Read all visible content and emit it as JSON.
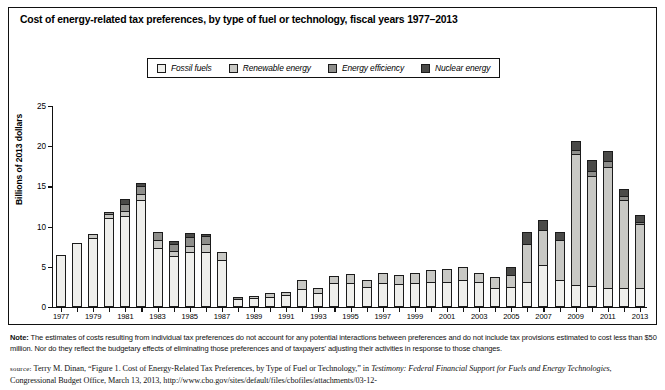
{
  "title": "Cost of energy-related tax preferences, by type of fuel or technology, fiscal years 1977–2013",
  "legend": {
    "items": [
      {
        "label": "Fossil fuels",
        "color": "#efefec"
      },
      {
        "label": "Renewable energy",
        "color": "#c8c8c4"
      },
      {
        "label": "Energy efficiency",
        "color": "#8e8e8b"
      },
      {
        "label": "Nuclear energy",
        "color": "#4a4a48"
      }
    ]
  },
  "note": {
    "label": "Note:",
    "text": "The estimates of costs resulting from individual tax preferences do not account for any potential interactions between preferences and do not include tax provisions estimated to cost less than $50 million. Nor do they reflect the budgetary effects of eliminating those preferences and of taxpayers’ adjusting their activities in response to those changes."
  },
  "source": {
    "label": "source:",
    "part1": "Terry M. Dinan, “Figure 1. Cost of Energy-Related Tax Preferences, by Type of Fuel or Technology,” in ",
    "italic1": "Testimony: Federal Financial Support for Fuels and Energy Technologies",
    "part2": ", Congressional Budget Office, March 13, 2013, http://www.cbo.gov/sites/default/files/cbofiles/attachments/03-12-"
  },
  "chart_data": {
    "type": "bar",
    "stacked": true,
    "title": "Cost of energy-related tax preferences, by type of fuel or technology, fiscal years 1977–2013",
    "xlabel": "",
    "ylabel": "Billions of 2013 dollars",
    "ylim": [
      0,
      25
    ],
    "yticks": [
      0,
      5,
      10,
      15,
      20,
      25
    ],
    "grid": false,
    "legend_position": "top",
    "categories": [
      "1977",
      "1978",
      "1979",
      "1980",
      "1981",
      "1982",
      "1983",
      "1984",
      "1985",
      "1986",
      "1987",
      "1988",
      "1989",
      "1990",
      "1991",
      "1992",
      "1993",
      "1994",
      "1995",
      "1996",
      "1997",
      "1998",
      "1999",
      "2000",
      "2001",
      "2002",
      "2003",
      "2004",
      "2005",
      "2006",
      "2007",
      "2008",
      "2009",
      "2010",
      "2011",
      "2012",
      "2013"
    ],
    "tick_labels": [
      "1977",
      "1979",
      "1981",
      "1983",
      "1985",
      "1987",
      "1989",
      "1991",
      "1993",
      "1995",
      "1997",
      "1999",
      "2001",
      "2003",
      "2005",
      "2007",
      "2009",
      "2011",
      "2013"
    ],
    "series": [
      {
        "name": "Fossil fuels",
        "color": "#efefec",
        "values": [
          6.5,
          8.0,
          8.6,
          11.1,
          11.3,
          13.3,
          7.3,
          6.3,
          6.8,
          6.9,
          5.9,
          1.0,
          1.1,
          1.3,
          1.5,
          2.2,
          1.7,
          3.0,
          3.0,
          2.5,
          3.0,
          2.9,
          3.0,
          3.1,
          3.1,
          3.4,
          3.1,
          2.4,
          2.5,
          3.1,
          5.2,
          3.3,
          2.7,
          2.6,
          2.4,
          2.4,
          2.4
        ]
      },
      {
        "name": "Renewable energy",
        "color": "#c8c8c4",
        "values": [
          0.0,
          0.0,
          0.6,
          0.6,
          0.7,
          0.9,
          1.1,
          0.8,
          0.9,
          1.0,
          1.1,
          0.0,
          0.4,
          0.5,
          0.5,
          1.3,
          0.8,
          1.0,
          1.2,
          1.0,
          1.3,
          1.2,
          1.4,
          1.6,
          1.7,
          1.7,
          1.3,
          1.4,
          1.6,
          4.9,
          4.5,
          5.2,
          16.5,
          13.8,
          15.1,
          11.0,
          8.0
        ]
      },
      {
        "name": "Energy efficiency",
        "color": "#8e8e8b",
        "values": [
          0.0,
          0.0,
          0.0,
          0.4,
          1.1,
          1.1,
          1.1,
          1.0,
          1.2,
          1.1,
          0.0,
          0.3,
          0.0,
          0.0,
          0.0,
          0.0,
          0.0,
          0.0,
          0.0,
          0.0,
          0.0,
          0.0,
          0.0,
          0.0,
          0.0,
          0.0,
          0.0,
          0.0,
          0.0,
          0.0,
          0.0,
          0.0,
          0.5,
          0.8,
          0.9,
          0.6,
          0.4
        ]
      },
      {
        "name": "Nuclear energy",
        "color": "#4a4a48",
        "values": [
          0.0,
          0.0,
          0.0,
          0.0,
          0.7,
          0.4,
          0.0,
          0.4,
          0.6,
          0.4,
          0.0,
          0.0,
          0.0,
          0.0,
          0.0,
          0.0,
          0.0,
          0.0,
          0.0,
          0.0,
          0.0,
          0.0,
          0.0,
          0.0,
          0.0,
          0.0,
          0.0,
          0.0,
          1.1,
          1.5,
          1.4,
          1.0,
          1.3,
          1.4,
          1.4,
          1.0,
          1.0
        ]
      }
    ]
  }
}
